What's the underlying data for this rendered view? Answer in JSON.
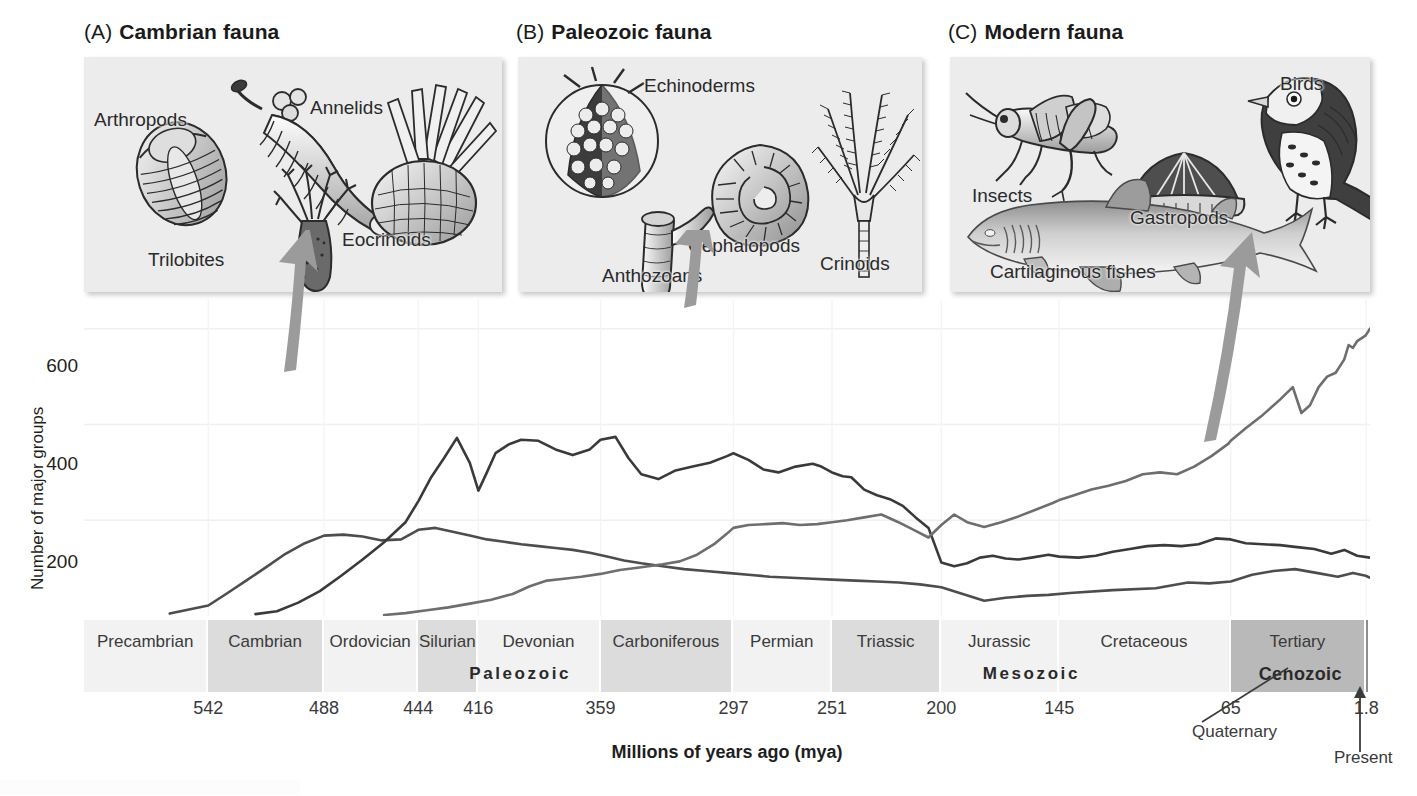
{
  "figure": {
    "panels": [
      {
        "tag": "(A)",
        "title": "Cambrian fauna",
        "organisms": [
          "Arthropods",
          "Annelids",
          "Trilobites",
          "Eocrinoids"
        ]
      },
      {
        "tag": "(B)",
        "title": "Paleozoic fauna",
        "organisms": [
          "Echinoderms",
          "Cephalopods",
          "Crinoids",
          "Anthozoans"
        ]
      },
      {
        "tag": "(C)",
        "title": "Modern fauna",
        "organisms": [
          "Insects",
          "Gastropods",
          "Birds",
          "Cartilaginous fishes"
        ]
      }
    ],
    "annotations": {
      "quaternary": "Quaternary",
      "present": "Present"
    },
    "colors": {
      "cambrian_curve": "#4d4d4d",
      "paleozoic_curve": "#3a3a3a",
      "modern_curve": "#6e6e6e",
      "arrow": "#9a9a9a",
      "panel_bg": "#ececed",
      "period_light": "#f2f2f2",
      "period_mid": "#dcdcdc",
      "period_dark": "#b9b9b9"
    }
  },
  "chart_data": {
    "type": "line",
    "title": "",
    "xlabel": "Millions of years ago (mya)",
    "ylabel": "Number of major groups",
    "xlim": [
      600,
      0
    ],
    "ylim": [
      0,
      660
    ],
    "y_ticks": [
      200,
      400,
      600
    ],
    "x_ticks": [
      542,
      488,
      444,
      416,
      359,
      297,
      251,
      200,
      145,
      65,
      1.8
    ],
    "x_tick_labels": [
      "542",
      "488",
      "444",
      "416",
      "359",
      "297",
      "251",
      "200",
      "145",
      "65",
      "1.8"
    ],
    "grid": true,
    "legend": "none",
    "periods": [
      {
        "name": "Precambrian",
        "start": 600,
        "end": 542,
        "era": "",
        "shade": "light"
      },
      {
        "name": "Cambrian",
        "start": 542,
        "end": 488,
        "era": "Paleozoic",
        "shade": "mid"
      },
      {
        "name": "Ordovician",
        "start": 488,
        "end": 444,
        "era": "Paleozoic",
        "shade": "light"
      },
      {
        "name": "Silurian",
        "start": 444,
        "end": 416,
        "era": "Paleozoic",
        "shade": "mid"
      },
      {
        "name": "Devonian",
        "start": 416,
        "end": 359,
        "era": "Paleozoic",
        "shade": "light"
      },
      {
        "name": "Carboniferous",
        "start": 359,
        "end": 297,
        "era": "Paleozoic",
        "shade": "mid"
      },
      {
        "name": "Permian",
        "start": 297,
        "end": 251,
        "era": "Paleozoic",
        "shade": "light"
      },
      {
        "name": "Triassic",
        "start": 251,
        "end": 200,
        "era": "Mesozoic",
        "shade": "mid"
      },
      {
        "name": "Jurassic",
        "start": 200,
        "end": 145,
        "era": "Mesozoic",
        "shade": "light"
      },
      {
        "name": "Cretaceous",
        "start": 145,
        "end": 65,
        "era": "Mesozoic",
        "shade": "light"
      },
      {
        "name": "Tertiary",
        "start": 65,
        "end": 1.8,
        "era": "Cenozoic",
        "shade": "dark"
      },
      {
        "name": "",
        "start": 1.8,
        "end": 0,
        "era": "Cenozoic",
        "shade": "darker"
      }
    ],
    "eras": [
      {
        "name": "Paleozoic",
        "start": 542,
        "end": 251
      },
      {
        "name": "Mesozoic",
        "start": 251,
        "end": 65
      },
      {
        "name": "Cenozoic",
        "start": 65,
        "end": 0
      }
    ],
    "series": [
      {
        "name": "Cambrian fauna",
        "color": "#4d4d4d",
        "points": [
          [
            560,
            5
          ],
          [
            542,
            22
          ],
          [
            533,
            48
          ],
          [
            524,
            75
          ],
          [
            515,
            102
          ],
          [
            506,
            130
          ],
          [
            497,
            152
          ],
          [
            488,
            168
          ],
          [
            479,
            170
          ],
          [
            470,
            166
          ],
          [
            461,
            158
          ],
          [
            452,
            160
          ],
          [
            444,
            180
          ],
          [
            436,
            184
          ],
          [
            428,
            176
          ],
          [
            420,
            168
          ],
          [
            412,
            160
          ],
          [
            404,
            155
          ],
          [
            396,
            150
          ],
          [
            388,
            146
          ],
          [
            380,
            142
          ],
          [
            372,
            138
          ],
          [
            364,
            132
          ],
          [
            356,
            124
          ],
          [
            348,
            116
          ],
          [
            340,
            110
          ],
          [
            330,
            104
          ],
          [
            320,
            98
          ],
          [
            310,
            94
          ],
          [
            300,
            90
          ],
          [
            290,
            86
          ],
          [
            280,
            82
          ],
          [
            270,
            80
          ],
          [
            260,
            78
          ],
          [
            251,
            76
          ],
          [
            240,
            74
          ],
          [
            230,
            72
          ],
          [
            220,
            70
          ],
          [
            210,
            66
          ],
          [
            200,
            60
          ],
          [
            190,
            46
          ],
          [
            180,
            32
          ],
          [
            170,
            38
          ],
          [
            160,
            42
          ],
          [
            150,
            44
          ],
          [
            140,
            48
          ],
          [
            120,
            54
          ],
          [
            100,
            58
          ],
          [
            85,
            70
          ],
          [
            75,
            68
          ],
          [
            65,
            72
          ],
          [
            55,
            86
          ],
          [
            45,
            94
          ],
          [
            35,
            98
          ],
          [
            25,
            90
          ],
          [
            15,
            82
          ],
          [
            8,
            90
          ],
          [
            2,
            84
          ],
          [
            0,
            80
          ]
        ]
      },
      {
        "name": "Paleozoic fauna",
        "color": "#3a3a3a",
        "points": [
          [
            520,
            4
          ],
          [
            510,
            10
          ],
          [
            500,
            28
          ],
          [
            490,
            52
          ],
          [
            480,
            84
          ],
          [
            470,
            118
          ],
          [
            460,
            154
          ],
          [
            450,
            196
          ],
          [
            444,
            240
          ],
          [
            438,
            290
          ],
          [
            432,
            330
          ],
          [
            426,
            372
          ],
          [
            420,
            320
          ],
          [
            416,
            262
          ],
          [
            412,
            300
          ],
          [
            408,
            340
          ],
          [
            402,
            358
          ],
          [
            396,
            368
          ],
          [
            388,
            366
          ],
          [
            380,
            348
          ],
          [
            372,
            336
          ],
          [
            364,
            348
          ],
          [
            359,
            368
          ],
          [
            352,
            374
          ],
          [
            346,
            330
          ],
          [
            340,
            296
          ],
          [
            332,
            286
          ],
          [
            324,
            304
          ],
          [
            316,
            312
          ],
          [
            308,
            320
          ],
          [
            300,
            334
          ],
          [
            297,
            340
          ],
          [
            290,
            326
          ],
          [
            283,
            306
          ],
          [
            276,
            300
          ],
          [
            268,
            312
          ],
          [
            260,
            318
          ],
          [
            256,
            312
          ],
          [
            251,
            300
          ],
          [
            246,
            292
          ],
          [
            242,
            290
          ],
          [
            236,
            264
          ],
          [
            230,
            252
          ],
          [
            224,
            244
          ],
          [
            218,
            230
          ],
          [
            212,
            206
          ],
          [
            206,
            184
          ],
          [
            200,
            112
          ],
          [
            194,
            104
          ],
          [
            188,
            110
          ],
          [
            182,
            122
          ],
          [
            176,
            126
          ],
          [
            170,
            120
          ],
          [
            164,
            118
          ],
          [
            158,
            122
          ],
          [
            150,
            128
          ],
          [
            145,
            124
          ],
          [
            136,
            122
          ],
          [
            128,
            126
          ],
          [
            120,
            134
          ],
          [
            112,
            140
          ],
          [
            104,
            146
          ],
          [
            96,
            148
          ],
          [
            88,
            146
          ],
          [
            80,
            150
          ],
          [
            72,
            162
          ],
          [
            65,
            160
          ],
          [
            58,
            152
          ],
          [
            50,
            150
          ],
          [
            42,
            148
          ],
          [
            34,
            144
          ],
          [
            26,
            140
          ],
          [
            18,
            130
          ],
          [
            12,
            138
          ],
          [
            6,
            126
          ],
          [
            0,
            122
          ]
        ]
      },
      {
        "name": "Modern fauna",
        "color": "#6e6e6e",
        "points": [
          [
            460,
            2
          ],
          [
            450,
            6
          ],
          [
            440,
            12
          ],
          [
            430,
            18
          ],
          [
            420,
            26
          ],
          [
            410,
            34
          ],
          [
            400,
            46
          ],
          [
            392,
            62
          ],
          [
            384,
            74
          ],
          [
            376,
            78
          ],
          [
            368,
            82
          ],
          [
            359,
            88
          ],
          [
            350,
            96
          ],
          [
            340,
            102
          ],
          [
            330,
            108
          ],
          [
            322,
            114
          ],
          [
            314,
            128
          ],
          [
            306,
            150
          ],
          [
            300,
            172
          ],
          [
            297,
            184
          ],
          [
            290,
            190
          ],
          [
            282,
            192
          ],
          [
            274,
            194
          ],
          [
            266,
            190
          ],
          [
            258,
            192
          ],
          [
            251,
            196
          ],
          [
            244,
            200
          ],
          [
            236,
            206
          ],
          [
            228,
            212
          ],
          [
            220,
            196
          ],
          [
            212,
            178
          ],
          [
            206,
            164
          ],
          [
            200,
            190
          ],
          [
            194,
            212
          ],
          [
            188,
            196
          ],
          [
            180,
            186
          ],
          [
            172,
            196
          ],
          [
            164,
            208
          ],
          [
            156,
            222
          ],
          [
            148,
            236
          ],
          [
            145,
            242
          ],
          [
            138,
            252
          ],
          [
            130,
            264
          ],
          [
            122,
            272
          ],
          [
            114,
            282
          ],
          [
            106,
            296
          ],
          [
            98,
            300
          ],
          [
            90,
            296
          ],
          [
            82,
            312
          ],
          [
            74,
            334
          ],
          [
            66,
            360
          ],
          [
            65,
            366
          ],
          [
            58,
            392
          ],
          [
            50,
            420
          ],
          [
            42,
            452
          ],
          [
            36,
            478
          ],
          [
            32,
            424
          ],
          [
            28,
            440
          ],
          [
            24,
            478
          ],
          [
            20,
            500
          ],
          [
            16,
            508
          ],
          [
            12,
            536
          ],
          [
            10,
            566
          ],
          [
            8,
            560
          ],
          [
            6,
            574
          ],
          [
            4,
            580
          ],
          [
            2,
            586
          ],
          [
            0,
            600
          ]
        ]
      }
    ]
  }
}
